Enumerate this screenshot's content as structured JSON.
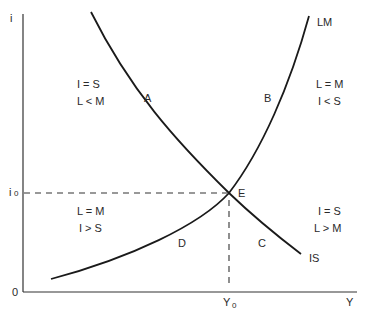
{
  "diagram": {
    "type": "IS-LM",
    "axes": {
      "y_label": "i",
      "x_label": "Y",
      "origin_label": "0",
      "y_tick_label": "i",
      "y_tick_subscript": "0",
      "x_tick_label": "Y",
      "x_tick_subscript": "0"
    },
    "curves": {
      "is": {
        "label": "IS"
      },
      "lm": {
        "label": "LM"
      }
    },
    "equilibrium": {
      "label": "E"
    },
    "regions": {
      "a": {
        "label": "A",
        "line1": "I = S",
        "line2": "L < M"
      },
      "b": {
        "label": "B",
        "line1": "L = M",
        "line2": "I < S"
      },
      "c": {
        "label": "C",
        "line1": "I = S",
        "line2": "L > M"
      },
      "d": {
        "label": "D",
        "line1": "L = M",
        "line2": "I > S"
      }
    },
    "colors": {
      "line": "#1a1a1a",
      "text": "#2a2a2a",
      "background": "#ffffff"
    }
  }
}
